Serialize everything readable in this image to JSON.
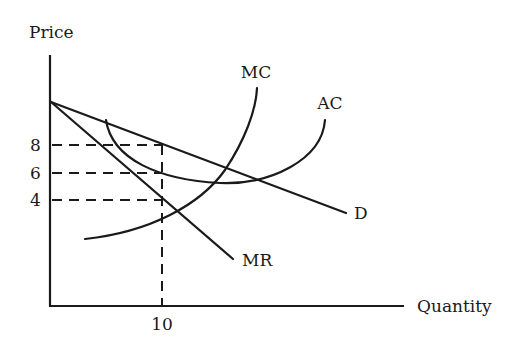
{
  "diagram": {
    "type": "economics-cost-revenue",
    "axes": {
      "y_title": "Price",
      "x_title": "Quantity"
    },
    "y_ticks": [
      {
        "value": "8",
        "label": "8"
      },
      {
        "value": "6",
        "label": "6"
      },
      {
        "value": "4",
        "label": "4"
      }
    ],
    "x_ticks": [
      {
        "value": "10",
        "label": "10"
      }
    ],
    "curves": {
      "mc": {
        "label": "MC"
      },
      "ac": {
        "label": "AC"
      },
      "demand": {
        "label": "D"
      },
      "mr": {
        "label": "MR"
      }
    },
    "reference_lines": {
      "quantity": "10",
      "price_levels": [
        "8",
        "6",
        "4"
      ]
    },
    "colors": {
      "ink": "#1a1a1a",
      "background": "#ffffff"
    }
  }
}
